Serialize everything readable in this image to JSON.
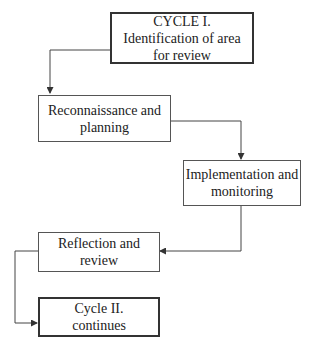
{
  "diagram": {
    "type": "flowchart",
    "nodes": [
      {
        "id": "cycle1",
        "lines": [
          "CYCLE I.",
          "Identification of area",
          "for review"
        ],
        "emphasis": true
      },
      {
        "id": "recon",
        "lines": [
          "Reconnaissance and",
          "planning"
        ],
        "emphasis": false
      },
      {
        "id": "impl",
        "lines": [
          "Implementation and",
          "monitoring"
        ],
        "emphasis": false
      },
      {
        "id": "reflect",
        "lines": [
          "Reflection and",
          "review"
        ],
        "emphasis": false
      },
      {
        "id": "cycle2",
        "lines": [
          "Cycle II.",
          "continues"
        ],
        "emphasis": true
      }
    ],
    "edges": [
      {
        "from": "cycle1",
        "to": "recon"
      },
      {
        "from": "recon",
        "to": "impl"
      },
      {
        "from": "impl",
        "to": "reflect"
      },
      {
        "from": "reflect",
        "to": "cycle2"
      }
    ]
  }
}
